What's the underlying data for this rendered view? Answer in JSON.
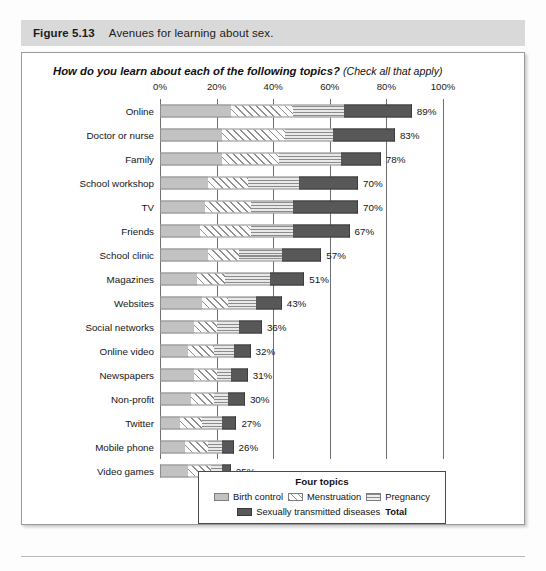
{
  "caption": {
    "number": "Figure 5.13",
    "text": "Avenues for learning about sex."
  },
  "chart_title": {
    "main": "How do you learn about each of the following topics?",
    "sub": "(Check all that apply)"
  },
  "legend": {
    "title": "Four topics",
    "items": [
      {
        "label": "Birth control",
        "swatch": "light-gray-fill",
        "color": "#c2c2c2"
      },
      {
        "label": "Menstruation",
        "swatch": "diagonal-hatch",
        "color": "#fdfdfd"
      },
      {
        "label": "Pregnancy",
        "swatch": "horizontal-lines",
        "color": "#e9e9e9"
      },
      {
        "label": "Sexually transmitted diseases",
        "swatch": "dark-gray-fill",
        "color": "#585858"
      }
    ],
    "total_label": "Total"
  },
  "chart_data": {
    "type": "bar",
    "orientation": "horizontal",
    "stacked": true,
    "title": "How do you learn about each of the following topics? (Check all that apply)",
    "xlabel": "",
    "ylabel": "",
    "xlim": [
      0,
      100
    ],
    "xticks": [
      0,
      20,
      40,
      60,
      80,
      100
    ],
    "xtick_labels": [
      "0%",
      "20%",
      "40%",
      "60%",
      "80%",
      "100%"
    ],
    "grid": true,
    "grid_axis": "x",
    "legend_position": "bottom",
    "value_label_suffix": "%",
    "categories": [
      "Online",
      "Doctor or nurse",
      "Family",
      "School workshop",
      "TV",
      "Friends",
      "School clinic",
      "Magazines",
      "Websites",
      "Social networks",
      "Online video",
      "Newspapers",
      "Non-profit",
      "Twitter",
      "Mobile phone",
      "Video games"
    ],
    "series": [
      {
        "name": "Birth control",
        "values": [
          25,
          22,
          22,
          17,
          16,
          14,
          17,
          13,
          15,
          12,
          10,
          12,
          11,
          7,
          9,
          10
        ]
      },
      {
        "name": "Menstruation",
        "values": [
          22,
          22,
          20,
          14,
          16,
          18,
          11,
          10,
          9,
          8,
          9,
          8,
          8,
          8,
          8,
          8
        ]
      },
      {
        "name": "Pregnancy",
        "values": [
          18,
          17,
          22,
          18,
          15,
          15,
          15,
          16,
          10,
          8,
          7,
          5,
          5,
          7,
          5,
          4
        ]
      },
      {
        "name": "Sexually transmitted diseases",
        "values": [
          24,
          22,
          14,
          21,
          23,
          20,
          14,
          12,
          9,
          8,
          6,
          6,
          6,
          5,
          4,
          3
        ]
      }
    ],
    "totals": [
      89,
      83,
      78,
      70,
      70,
      67,
      57,
      51,
      43,
      36,
      32,
      31,
      30,
      27,
      26,
      25
    ],
    "total_labels": [
      "89%",
      "83%",
      "78%",
      "70%",
      "70%",
      "67%",
      "57%",
      "51%",
      "43%",
      "36%",
      "32%",
      "31%",
      "30%",
      "27%",
      "26%",
      "25%"
    ]
  }
}
